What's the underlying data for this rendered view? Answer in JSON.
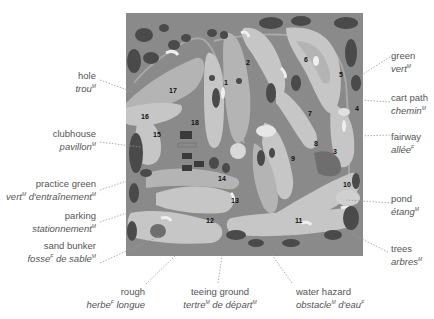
{
  "figure": {
    "hole_numbers": [
      "1",
      "2",
      "3",
      "4",
      "5",
      "6",
      "7",
      "8",
      "9",
      "10",
      "11",
      "12",
      "13",
      "14",
      "15",
      "16",
      "17",
      "18"
    ]
  },
  "labels": {
    "hole": {
      "en": "hole",
      "fr": "trou",
      "fr_gender": "M"
    },
    "clubhouse": {
      "en": "clubhouse",
      "fr": "pavillon",
      "fr_gender": "M"
    },
    "practice_green": {
      "en": "practice green",
      "fr": "vert",
      "fr_gender": "M",
      "fr2": " d'entraînement",
      "fr2_gender": "M"
    },
    "parking": {
      "en": "parking",
      "fr": "stationnement",
      "fr_gender": "M"
    },
    "sand_bunker": {
      "en": "sand bunker",
      "fr": "fosse",
      "fr_gender": "F",
      "fr2": " de sable",
      "fr2_gender": "M"
    },
    "rough": {
      "en": "rough",
      "fr": "herbe",
      "fr_gender": "F",
      "fr2": " longue"
    },
    "teeing_ground": {
      "en": "teeing ground",
      "fr": "tertre",
      "fr_gender": "M",
      "fr2": " de départ",
      "fr2_gender": "M"
    },
    "water_hazard": {
      "en": "water hazard",
      "fr": "obstacle",
      "fr_gender": "M",
      "fr2": " d'eau",
      "fr2_gender": "F"
    },
    "trees": {
      "en": "trees",
      "fr": "arbres",
      "fr_gender": "M"
    },
    "pond": {
      "en": "pond",
      "fr": "étang",
      "fr_gender": "M"
    },
    "fairway": {
      "en": "fairway",
      "fr": "allée",
      "fr_gender": "F"
    },
    "cart_path": {
      "en": "cart path",
      "fr": "chemin",
      "fr_gender": "M"
    },
    "green": {
      "en": "green",
      "fr": "vert",
      "fr_gender": "M"
    }
  },
  "colors": {
    "rough": "#8a8a8a",
    "fairway": "#b4b4b4",
    "light_fairway": "#c6c6c6",
    "trees": "#4a4a4a",
    "sand": "#efefef",
    "water": "#6e6e6e",
    "leader": "#9a9a9a",
    "text": "#555555"
  }
}
